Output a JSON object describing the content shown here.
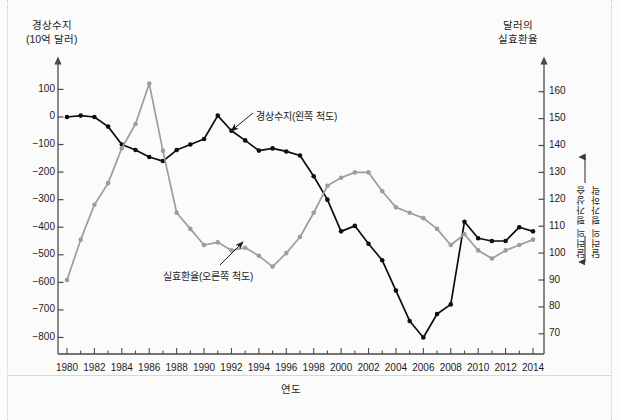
{
  "axes": {
    "left_title_line1": "경상수지",
    "left_title_line2": "(10억 달러)",
    "right_title_line1": "달러의",
    "right_title_line2": "실효환율",
    "x_title": "연도"
  },
  "annotations": {
    "current_account": "경상수지(왼쪽 척도)",
    "exchange_rate": "실효환율(오른쪽 척도)",
    "appreciation": "달러의 평가상승",
    "depreciation": "달러의 평가하락"
  },
  "colors": {
    "series_current_account": "#0d0d0d",
    "series_exchange_rate": "#9d9d9d",
    "axis": "#4a4a4a",
    "background": "#fbfbfb",
    "text": "#1d1d1d"
  },
  "chart_data": {
    "type": "line",
    "title": "",
    "xlabel": "연도",
    "grid": false,
    "legend_position": "inline-annotations",
    "x": [
      1980,
      1981,
      1982,
      1983,
      1984,
      1985,
      1986,
      1987,
      1988,
      1989,
      1990,
      1991,
      1992,
      1993,
      1994,
      1995,
      1996,
      1997,
      1998,
      1999,
      2000,
      2001,
      2002,
      2003,
      2004,
      2005,
      2006,
      2007,
      2008,
      2009,
      2010,
      2011,
      2012,
      2013,
      2014
    ],
    "xlim": [
      1979.3,
      2014.9
    ],
    "xticks": [
      1980,
      1982,
      1984,
      1986,
      1988,
      1990,
      1992,
      1994,
      1996,
      1998,
      2000,
      2002,
      2004,
      2006,
      2008,
      2010,
      2012,
      2014
    ],
    "left_axis": {
      "label": "경상수지 (10억 달러)",
      "ylim": [
        -860,
        165
      ],
      "yticks": [
        100,
        0,
        -100,
        -200,
        -300,
        -400,
        -500,
        -600,
        -700,
        -800
      ],
      "ytick_labels": [
        "100",
        "0",
        "−100",
        "−200",
        "−300",
        "−400",
        "−500",
        "−600",
        "−700",
        "−800"
      ]
    },
    "right_axis": {
      "label": "달러의 실효환율",
      "ylim": [
        62.5,
        167.5
      ],
      "yticks": [
        160,
        150,
        140,
        130,
        120,
        110,
        100,
        90,
        80,
        70
      ],
      "ytick_labels": [
        "160",
        "150",
        "140",
        "130",
        "120",
        "110",
        "100",
        "90",
        "80",
        "70"
      ]
    },
    "series": [
      {
        "name": "경상수지(왼쪽 척도)",
        "axis": "left",
        "color": "#0d0d0d",
        "marker": "circle",
        "values": [
          0,
          5,
          0,
          -35,
          -100,
          -120,
          -145,
          -160,
          -120,
          -100,
          -80,
          5,
          -50,
          -85,
          -122,
          -114,
          -125,
          -140,
          -215,
          -300,
          -415,
          -395,
          -460,
          -520,
          -630,
          -740,
          -800,
          -715,
          -680,
          -380,
          -440,
          -450,
          -450,
          -400,
          -415
        ]
      },
      {
        "name": "실효환율(오른쪽 척도)",
        "axis": "right",
        "color": "#9d9d9d",
        "marker": "circle",
        "values": [
          90,
          105,
          118,
          126,
          139,
          148,
          163,
          138,
          115,
          109,
          103,
          104,
          101,
          102,
          99,
          95,
          100,
          106,
          115,
          125,
          128,
          130,
          130,
          123,
          117,
          115,
          113,
          109,
          103,
          107,
          101,
          98,
          101,
          103,
          105
        ]
      }
    ]
  }
}
